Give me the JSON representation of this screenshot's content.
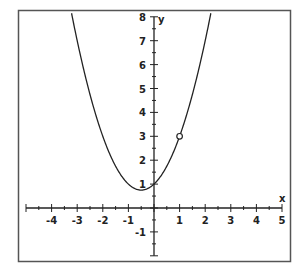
{
  "chart_data": {
    "type": "line",
    "title": "",
    "function": "y = x^2 + x + 1",
    "xlabel": "x",
    "ylabel": "y",
    "xlim": [
      -5,
      5
    ],
    "ylim": [
      -2,
      8
    ],
    "x_ticks": [
      -4,
      -3,
      -2,
      -1,
      1,
      2,
      3,
      4,
      5
    ],
    "y_ticks": [
      -1,
      1,
      2,
      3,
      4,
      5,
      6,
      7,
      8
    ],
    "x_minor_step": 0.5,
    "y_minor_step": 0.5,
    "grid": false,
    "legend": null,
    "series": [
      {
        "name": "parabola",
        "x": [
          -3.2,
          -3,
          -2.5,
          -2,
          -1.5,
          -1,
          -0.5,
          0,
          0.5,
          1,
          1.5,
          2,
          2.25
        ],
        "y": [
          8.04,
          7,
          4.75,
          3,
          1.75,
          1,
          0.75,
          1,
          1.75,
          3,
          4.75,
          7,
          8.31
        ]
      }
    ],
    "annotations": [
      {
        "type": "open-circle",
        "x": 1,
        "y": 3,
        "meaning": "hole (point excluded)"
      }
    ],
    "colors": {
      "curve": "#222222",
      "axes": "#222222",
      "frame": "#555555",
      "background": "#ffffff"
    }
  },
  "labels": {
    "x_axis": "x",
    "y_axis": "y",
    "x_ticks": [
      "-4",
      "-3",
      "-2",
      "-1",
      "1",
      "2",
      "3",
      "4",
      "5"
    ],
    "y_ticks": [
      "-1",
      "1",
      "2",
      "3",
      "4",
      "5",
      "6",
      "7",
      "8"
    ]
  }
}
